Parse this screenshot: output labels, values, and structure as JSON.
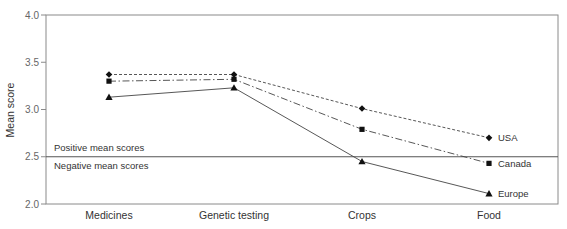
{
  "chart_data": {
    "type": "line",
    "title": "",
    "xlabel": "",
    "ylabel": "Mean score",
    "ylim": [
      2.0,
      4.0
    ],
    "yticks": [
      "2.0",
      "2.5",
      "3.0",
      "3.5",
      "4.0"
    ],
    "grid": false,
    "legend_position": "inline labels at right end of lines",
    "categories": [
      "Medicines",
      "Genetic testing",
      "Crops",
      "Food"
    ],
    "series": [
      {
        "name": "USA",
        "marker": "diamond",
        "line_style": "dashed",
        "values": [
          3.37,
          3.37,
          3.01,
          2.7
        ]
      },
      {
        "name": "Canada",
        "marker": "square",
        "line_style": "dash-dot",
        "values": [
          3.3,
          3.32,
          2.79,
          2.43
        ]
      },
      {
        "name": "Europe",
        "marker": "triangle",
        "line_style": "solid",
        "values": [
          3.13,
          3.23,
          2.45,
          2.11
        ]
      }
    ],
    "reference_line": {
      "value": 2.5,
      "label_above": "Positive mean scores",
      "label_below": "Negative mean scores"
    }
  }
}
